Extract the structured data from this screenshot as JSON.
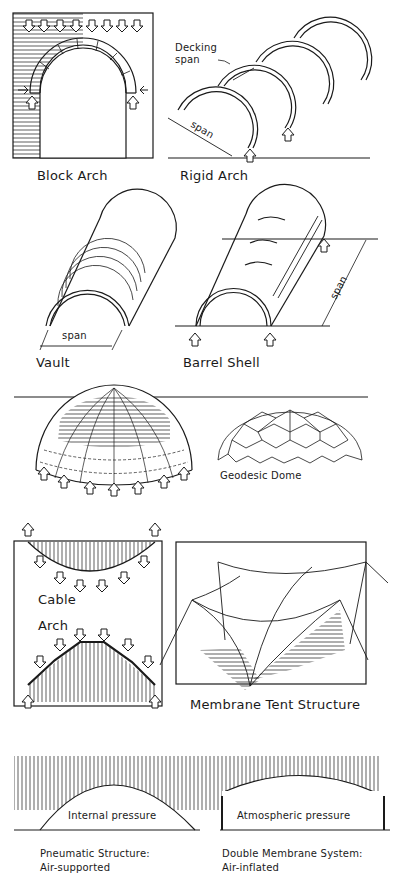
{
  "diagram": {
    "panels": [
      {
        "id": "block-arch",
        "label": "Block Arch"
      },
      {
        "id": "rigid-arch",
        "label": "Rigid Arch",
        "annotations": {
          "decking": "Decking",
          "decking2": "span",
          "span": "span"
        }
      },
      {
        "id": "vault",
        "label": "Vault",
        "annotations": {
          "span": "span"
        }
      },
      {
        "id": "barrel-shell",
        "label": "Barrel Shell",
        "annotations": {
          "span": "span"
        }
      },
      {
        "id": "dome",
        "label": ""
      },
      {
        "id": "geodesic-dome",
        "label": "Geodesic Dome"
      },
      {
        "id": "cable-arch",
        "label_cable": "Cable",
        "label_arch": "Arch"
      },
      {
        "id": "membrane-tent",
        "label": "Membrane Tent Structure"
      },
      {
        "id": "pneumatic",
        "label_line1": "Pneumatic Structure:",
        "label_line2": "Air-supported",
        "annotations": {
          "pressure": "Internal pressure"
        }
      },
      {
        "id": "double-membrane",
        "label_line1": "Double Membrane System:",
        "label_line2": "Air-inflated",
        "annotations": {
          "pressure": "Atmospheric pressure"
        }
      }
    ]
  },
  "colors": {
    "ink": "#1a1a1a",
    "background": "#ffffff"
  }
}
